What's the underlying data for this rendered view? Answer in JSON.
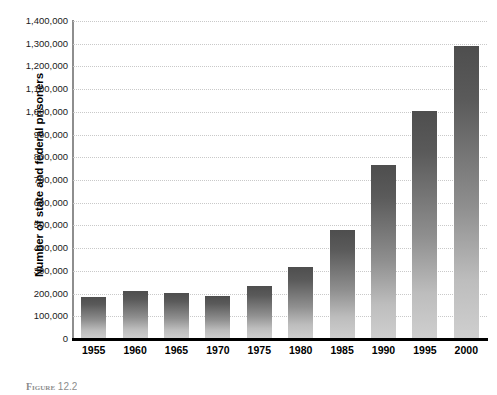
{
  "chart_data": {
    "type": "bar",
    "title": "",
    "xlabel": "",
    "ylabel": "Number of state and federal prisoners",
    "categories": [
      "1955",
      "1960",
      "1965",
      "1970",
      "1975",
      "1980",
      "1985",
      "1990",
      "1995",
      "2000"
    ],
    "values": [
      185000,
      213000,
      202000,
      190000,
      235000,
      316000,
      480000,
      765000,
      1005000,
      1290000
    ],
    "ylim": [
      0,
      1400000
    ],
    "ytick_values": [
      0,
      100000,
      200000,
      300000,
      400000,
      500000,
      600000,
      700000,
      800000,
      900000,
      1000000,
      1100000,
      1200000,
      1300000,
      1400000
    ],
    "ytick_labels": [
      "0",
      "100,000",
      "200,000",
      "300,000",
      "400,000",
      "500,000",
      "600,000",
      "700,000",
      "800,000",
      "900,000",
      "1,000,000",
      "1,100,000",
      "1,200,000",
      "1,300,000",
      "1,400,000"
    ],
    "grid": true,
    "grid_color": "#c9c9c9",
    "legend": false,
    "bar_color_top": "#4e4e4e",
    "bar_color_bottom": "#cfcfcf",
    "axis_color": "#8e8e8e",
    "baseline_color": "#000000"
  },
  "caption": {
    "label": "Figure",
    "text": "12.2"
  }
}
